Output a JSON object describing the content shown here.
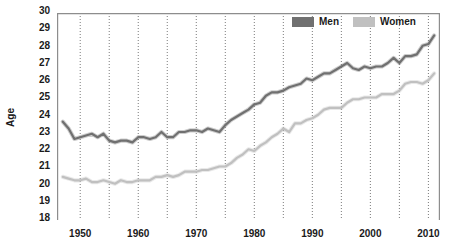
{
  "chart_data": {
    "type": "line",
    "title": "",
    "xlabel": "",
    "ylabel": "Age",
    "xlim": [
      1946,
      2012
    ],
    "ylim": [
      18,
      30
    ],
    "ytick_step": 1,
    "xtick_step": 10,
    "grid": {
      "vertical": true,
      "horizontal": false,
      "vertical_step": 5,
      "style": "dotted",
      "color": "#6b6b6b"
    },
    "legend_position": "top-right",
    "yticks": [
      18,
      19,
      20,
      21,
      22,
      23,
      24,
      25,
      26,
      27,
      28,
      29,
      30
    ],
    "xticks": [
      1950,
      1960,
      1970,
      1980,
      1990,
      2000,
      2010
    ],
    "x": [
      1947,
      1948,
      1949,
      1950,
      1951,
      1952,
      1953,
      1954,
      1955,
      1956,
      1957,
      1958,
      1959,
      1960,
      1961,
      1962,
      1963,
      1964,
      1965,
      1966,
      1967,
      1968,
      1969,
      1970,
      1971,
      1972,
      1973,
      1974,
      1975,
      1976,
      1977,
      1978,
      1979,
      1980,
      1981,
      1982,
      1983,
      1984,
      1985,
      1986,
      1987,
      1988,
      1989,
      1990,
      1991,
      1992,
      1993,
      1994,
      1995,
      1996,
      1997,
      1998,
      1999,
      2000,
      2001,
      2002,
      2003,
      2004,
      2005,
      2006,
      2007,
      2008,
      2009,
      2010,
      2011
    ],
    "series": [
      {
        "name": "Men",
        "color": "#707070",
        "values": [
          23.7,
          23.3,
          22.7,
          22.8,
          22.9,
          23.0,
          22.8,
          23.0,
          22.6,
          22.5,
          22.6,
          22.6,
          22.5,
          22.8,
          22.8,
          22.7,
          22.8,
          23.1,
          22.8,
          22.8,
          23.1,
          23.1,
          23.2,
          23.2,
          23.1,
          23.3,
          23.2,
          23.1,
          23.5,
          23.8,
          24.0,
          24.2,
          24.4,
          24.7,
          24.8,
          25.2,
          25.4,
          25.4,
          25.5,
          25.7,
          25.8,
          25.9,
          26.2,
          26.1,
          26.3,
          26.5,
          26.5,
          26.7,
          26.9,
          27.1,
          26.8,
          26.7,
          26.9,
          26.8,
          26.9,
          26.9,
          27.1,
          27.4,
          27.1,
          27.5,
          27.5,
          27.6,
          28.1,
          28.2,
          28.7
        ]
      },
      {
        "name": "Women",
        "color": "#c0c0c0",
        "values": [
          20.5,
          20.4,
          20.3,
          20.3,
          20.4,
          20.2,
          20.2,
          20.3,
          20.2,
          20.1,
          20.3,
          20.2,
          20.2,
          20.3,
          20.3,
          20.3,
          20.5,
          20.5,
          20.6,
          20.5,
          20.6,
          20.8,
          20.8,
          20.8,
          20.9,
          20.9,
          21.0,
          21.1,
          21.1,
          21.3,
          21.6,
          21.8,
          22.1,
          22.0,
          22.3,
          22.5,
          22.8,
          23.0,
          23.3,
          23.1,
          23.6,
          23.6,
          23.8,
          23.9,
          24.1,
          24.4,
          24.5,
          24.5,
          24.5,
          24.8,
          25.0,
          25.0,
          25.1,
          25.1,
          25.1,
          25.3,
          25.3,
          25.3,
          25.5,
          25.9,
          26.0,
          26.0,
          25.9,
          26.1,
          26.5
        ]
      }
    ],
    "annotations": []
  },
  "legend": {
    "entries": [
      {
        "label": "Men",
        "color": "#707070"
      },
      {
        "label": "Women",
        "color": "#c0c0c0"
      }
    ]
  },
  "axes": {
    "y_title": "Age"
  }
}
